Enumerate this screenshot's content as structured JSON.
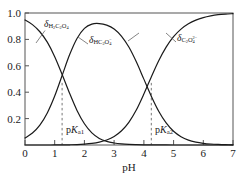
{
  "chart_data": {
    "type": "line",
    "title": "",
    "xlabel": "pH",
    "ylabel": "",
    "xlim": [
      0,
      7
    ],
    "ylim": [
      0,
      1.0
    ],
    "grid": false,
    "legend": "inline-labels",
    "x_ticks": [
      "0",
      "1",
      "2",
      "3",
      "4",
      "5",
      "6",
      "7"
    ],
    "y_ticks": [
      "1.0",
      "0.8",
      "0.6",
      "0.4",
      "0.2"
    ],
    "x_tick_values": [
      0,
      1,
      2,
      3,
      4,
      5,
      6,
      7
    ],
    "y_tick_values": [
      1.0,
      0.8,
      0.6,
      0.4,
      0.2
    ],
    "x": [
      0,
      0.25,
      0.5,
      0.75,
      1.0,
      1.25,
      1.5,
      1.75,
      2.0,
      2.25,
      2.5,
      2.75,
      3.0,
      3.25,
      3.5,
      3.75,
      4.0,
      4.25,
      4.5,
      4.75,
      5.0,
      5.25,
      5.5,
      5.75,
      6.0,
      6.25,
      6.5,
      6.75,
      7.0
    ],
    "series": [
      {
        "name": "delta-H2C2O4",
        "label_text": "H2C2O4",
        "values": [
          0.947,
          0.912,
          0.858,
          0.779,
          0.669,
          0.534,
          0.392,
          0.262,
          0.161,
          0.092,
          0.05,
          0.027,
          0.015,
          0.008,
          0.0042,
          0.0023,
          0.0012,
          0.0006,
          0.0003,
          0.0002,
          0.0001,
          0.0,
          0.0,
          0.0,
          0.0,
          0.0,
          0.0,
          0.0,
          0.0
        ]
      },
      {
        "name": "delta-HC2O4-",
        "label_text": "HC2O4-",
        "values": [
          0.053,
          0.091,
          0.151,
          0.243,
          0.371,
          0.527,
          0.683,
          0.807,
          0.883,
          0.916,
          0.92,
          0.908,
          0.878,
          0.823,
          0.74,
          0.628,
          0.499,
          0.37,
          0.256,
          0.167,
          0.104,
          0.063,
          0.037,
          0.022,
          0.013,
          0.0075,
          0.0043,
          0.0024,
          0.0014
        ]
      },
      {
        "name": "delta-C2O4-2",
        "label_text": "C2O4 2-",
        "values": [
          0.0,
          0.0,
          0.0,
          0.0,
          0.0003,
          0.0007,
          0.0017,
          0.0035,
          0.0068,
          0.0122,
          0.0218,
          0.0382,
          0.065,
          0.108,
          0.174,
          0.267,
          0.386,
          0.516,
          0.639,
          0.742,
          0.821,
          0.878,
          0.918,
          0.946,
          0.965,
          0.978,
          0.987,
          0.992,
          0.995
        ]
      }
    ],
    "annotations": [
      {
        "name": "pKa1",
        "text": "pKa1",
        "x": 1.25,
        "y_top": 0.47
      },
      {
        "name": "pKa2",
        "text": "pKa2",
        "x": 4.25,
        "y_top": 0.47
      }
    ]
  },
  "labels": {
    "series1": {
      "delta": "δ",
      "sub_main": "H",
      "n1": "2",
      "c": "C",
      "n2": "2",
      "o": "O",
      "n3": "4"
    },
    "series2": {
      "delta": "δ"
    },
    "series3": {
      "delta": "δ"
    },
    "pka1_p": "p",
    "pka1_k": "K",
    "pka1_sub": "a1",
    "pka2_p": "p",
    "pka2_k": "K",
    "pka2_sub": "a2",
    "xaxis": "pH"
  },
  "ticks": {
    "y": [
      "1.0",
      "0.8",
      "0.6",
      "0.4",
      "0.2"
    ],
    "x": [
      "0",
      "1",
      "2",
      "3",
      "4",
      "5",
      "6",
      "7"
    ]
  },
  "colors": {
    "curve": "#1a1a1a",
    "axis": "#555555",
    "dashed": "#777777",
    "background": "#ffffff"
  }
}
